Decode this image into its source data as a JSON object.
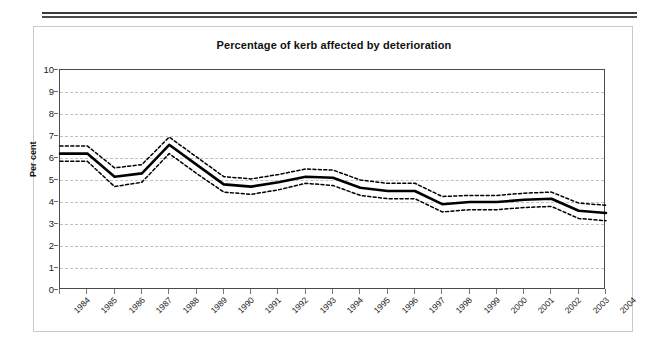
{
  "chart_data": {
    "type": "line",
    "title": "Percentage of kerb affected by deterioration",
    "xlabel": "",
    "ylabel": "Per cent",
    "ylim": [
      0,
      10
    ],
    "ytick_labels": [
      "0",
      "1",
      "2",
      "3",
      "4",
      "5",
      "6",
      "7",
      "8",
      "9",
      "10"
    ],
    "grid": true,
    "legend": "none",
    "categories": [
      "1984",
      "1985",
      "1986",
      "1987",
      "1988",
      "1989",
      "1990",
      "1991",
      "1992",
      "1993",
      "1994",
      "1995",
      "1996",
      "1997",
      "1998",
      "1999",
      "2000",
      "2001",
      "2002",
      "2003",
      "2004"
    ],
    "series": [
      {
        "name": "Percentage of kerb affected by deterioration",
        "style": "solid",
        "values": [
          6.2,
          6.2,
          5.15,
          5.3,
          6.6,
          5.7,
          4.8,
          4.7,
          4.9,
          5.15,
          5.1,
          4.65,
          4.5,
          4.5,
          3.9,
          4.0,
          4.0,
          4.1,
          4.15,
          3.6,
          3.5
        ]
      },
      {
        "name": "Upper confidence limit",
        "style": "dotted",
        "values": [
          6.55,
          6.55,
          5.55,
          5.7,
          6.95,
          6.05,
          5.15,
          5.05,
          5.25,
          5.5,
          5.45,
          5.0,
          4.85,
          4.85,
          4.25,
          4.3,
          4.3,
          4.4,
          4.45,
          3.95,
          3.85
        ]
      },
      {
        "name": "Lower confidence limit",
        "style": "dotted",
        "values": [
          5.85,
          5.85,
          4.7,
          4.9,
          6.2,
          5.3,
          4.45,
          4.35,
          4.55,
          4.85,
          4.75,
          4.3,
          4.15,
          4.15,
          3.55,
          3.65,
          3.65,
          3.75,
          3.8,
          3.25,
          3.15
        ]
      }
    ]
  },
  "colors": {
    "line": "#000000",
    "grid": "#c0c0c0",
    "axis": "#4a4a4a",
    "text": "#111111",
    "card_border": "#c9c9c9",
    "rule": "#3a3a3a"
  }
}
